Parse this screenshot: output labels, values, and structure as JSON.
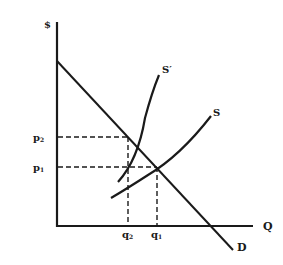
{
  "diagram": {
    "type": "supply-demand",
    "axes": {
      "y_label": "$",
      "x_label": "Q"
    },
    "curves": {
      "demand": {
        "label": "D"
      },
      "supply": {
        "label": "S"
      },
      "supply_shifted": {
        "label": "S′"
      }
    },
    "price_levels": [
      {
        "label": "p",
        "sub": "2"
      },
      {
        "label": "p",
        "sub": "1"
      }
    ],
    "quantity_levels": [
      {
        "label": "q",
        "sub": "2"
      },
      {
        "label": "q",
        "sub": "1"
      }
    ],
    "colors": {
      "ink": "#1a1a1a",
      "background": "#ffffff"
    }
  }
}
